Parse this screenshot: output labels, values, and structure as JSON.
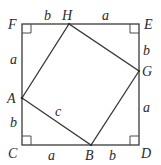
{
  "diagram": {
    "type": "geometry",
    "colors": {
      "stroke": "#3a3a3a",
      "text": "#2a2a2a",
      "background": "#ffffff"
    },
    "points": {
      "F": {
        "label": "F",
        "x": 22,
        "y": 24
      },
      "E": {
        "label": "E",
        "x": 139,
        "y": 24
      },
      "D": {
        "label": "D",
        "x": 139,
        "y": 145
      },
      "C": {
        "label": "C",
        "x": 22,
        "y": 145
      },
      "H": {
        "label": "H",
        "x": 69,
        "y": 24
      },
      "G": {
        "label": "G",
        "x": 139,
        "y": 71
      },
      "B": {
        "label": "B",
        "x": 91,
        "y": 145
      },
      "A": {
        "label": "A",
        "x": 22,
        "y": 98
      }
    },
    "segment_labels": {
      "FH": "b",
      "HE": "a",
      "EG": "b",
      "GD": "a",
      "DB": "b",
      "BC": "a",
      "CA": "b",
      "AF": "a",
      "AB": "c"
    },
    "right_angles": [
      "F",
      "E",
      "D",
      "C"
    ]
  }
}
